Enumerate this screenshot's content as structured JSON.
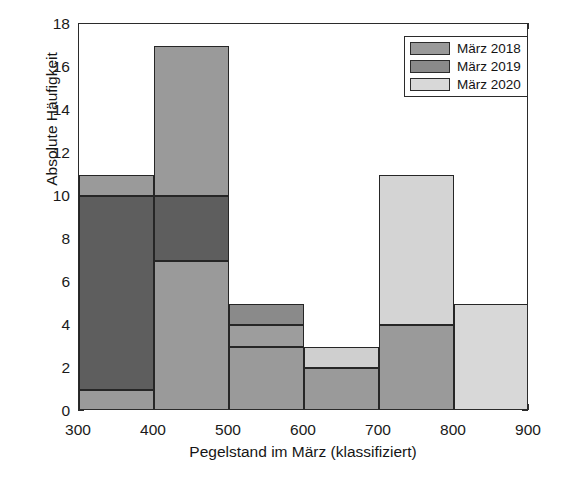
{
  "figure": {
    "background": "#ffffff",
    "axis_color": "#2b2b2b"
  },
  "axes": {
    "y_title": "Absolute Häufigkeit",
    "x_title": "Pegelstand im März (klassifiziert)",
    "y_ticks": [
      "0",
      "2",
      "4",
      "6",
      "8",
      "10",
      "12",
      "14",
      "16",
      "18"
    ],
    "x_ticks": [
      "300",
      "400",
      "500",
      "600",
      "700",
      "800",
      "900"
    ]
  },
  "legend": {
    "items": [
      {
        "label": "März 2018",
        "color": "#9a9a9a"
      },
      {
        "label": "März 2019",
        "color": "#8a8a8a"
      },
      {
        "label": "März 2020",
        "color": "#d8d8d8"
      }
    ]
  },
  "chart_data": {
    "type": "bar",
    "title": "",
    "xlabel": "Pegelstand im März (klassifiziert)",
    "ylabel": "Absolute Häufigkeit",
    "xlim": [
      300,
      900
    ],
    "ylim": [
      0,
      18
    ],
    "grid": false,
    "legend_position": "top-right",
    "bin_edges": [
      300,
      400,
      500,
      600,
      700,
      800,
      900
    ],
    "categories": [
      "300-400",
      "400-500",
      "500-600",
      "600-700",
      "700-800",
      "800-900"
    ],
    "series": [
      {
        "name": "März 2018",
        "color": "#9a9a9a",
        "values": [
          11,
          17,
          5,
          0,
          0,
          0
        ]
      },
      {
        "name": "März 2019",
        "color": "#8a8a8a",
        "values": [
          10,
          10,
          4,
          2,
          4,
          0
        ]
      },
      {
        "name": "März 2020",
        "color": "#d8d8d8",
        "values": [
          1,
          7,
          3,
          3,
          11,
          5
        ]
      }
    ],
    "note": "Overlapping semi-transparent histogram; darker regions are overlaps of März 2018 and März 2019."
  },
  "render": {
    "segments": [
      {
        "name": "bin1-2018-top",
        "bin": 0,
        "y0": 10,
        "y1": 11,
        "fill": "#9a9a9a",
        "edge": true
      },
      {
        "name": "bin1-overlap",
        "bin": 0,
        "y0": 1,
        "y1": 10,
        "fill": "#5e5e5e",
        "edge": true
      },
      {
        "name": "bin1-bottom-2020",
        "bin": 0,
        "y0": 0,
        "y1": 1,
        "fill": "#9a9a9a",
        "edge": true
      },
      {
        "name": "bin2-2018-top",
        "bin": 1,
        "y0": 10,
        "y1": 17,
        "fill": "#9a9a9a",
        "edge": true
      },
      {
        "name": "bin2-overlap",
        "bin": 1,
        "y0": 7,
        "y1": 10,
        "fill": "#5e5e5e",
        "edge": true
      },
      {
        "name": "bin2-lower",
        "bin": 1,
        "y0": 0,
        "y1": 7,
        "fill": "#9a9a9a",
        "edge": true
      },
      {
        "name": "bin3-overlap",
        "bin": 2,
        "y0": 4,
        "y1": 5,
        "fill": "#8a8a8a",
        "edge": true
      },
      {
        "name": "bin3-mid",
        "bin": 2,
        "y0": 3,
        "y1": 4,
        "fill": "#9d9d9d",
        "edge": true
      },
      {
        "name": "bin3-lower",
        "bin": 2,
        "y0": 0,
        "y1": 3,
        "fill": "#9a9a9a",
        "edge": true
      },
      {
        "name": "bin4-2020-top",
        "bin": 3,
        "y0": 2,
        "y1": 3,
        "fill": "#cfcfcf",
        "edge": true
      },
      {
        "name": "bin4-lower",
        "bin": 3,
        "y0": 0,
        "y1": 2,
        "fill": "#9a9a9a",
        "edge": true
      },
      {
        "name": "bin5-2020-top",
        "bin": 4,
        "y0": 4,
        "y1": 11,
        "fill": "#d4d4d4",
        "edge": true
      },
      {
        "name": "bin5-overlap",
        "bin": 4,
        "y0": 0,
        "y1": 4,
        "fill": "#9a9a9a",
        "edge": true
      },
      {
        "name": "bin6-2020",
        "bin": 5,
        "y0": 0,
        "y1": 5,
        "fill": "#d8d8d8",
        "edge": true
      }
    ]
  }
}
